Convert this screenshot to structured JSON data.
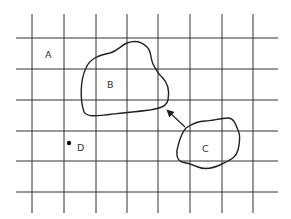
{
  "diagram": {
    "grid": {
      "vertical_x": [
        32,
        64,
        96,
        127,
        158,
        190,
        222,
        253
      ],
      "vertical_y_range": [
        14,
        213
      ],
      "horizontal_y": [
        38,
        69,
        100,
        131,
        161,
        192
      ],
      "horizontal_x_range": [
        16,
        278
      ],
      "color": "#333333"
    },
    "regions": [
      {
        "id": "B",
        "label": "B",
        "label_pos": [
          107,
          88
        ]
      },
      {
        "id": "C",
        "label": "C",
        "label_pos": [
          202,
          152
        ]
      }
    ],
    "labels": [
      {
        "id": "A",
        "text": "A",
        "pos": [
          45,
          58
        ]
      },
      {
        "id": "D",
        "text": "D",
        "pos": [
          77,
          151
        ]
      }
    ],
    "point": {
      "id": "D",
      "pos": [
        69,
        143
      ]
    },
    "arrow": {
      "from": "C",
      "to": "B",
      "tail": [
        185,
        127
      ],
      "head": [
        166,
        109
      ]
    }
  }
}
